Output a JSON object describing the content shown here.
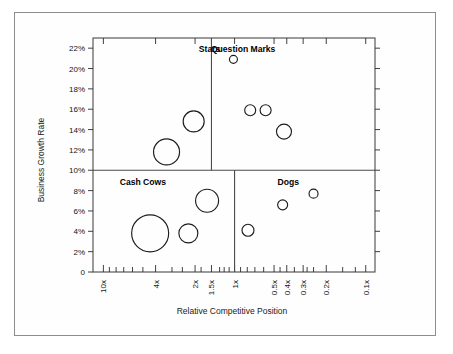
{
  "chart_data": {
    "type": "scatter",
    "title": "",
    "xlabel": "Relative Competitive Position",
    "ylabel": "Business Growth Rate",
    "grid": false,
    "legend": "none",
    "x_scale": "log-reversed",
    "x_tick_labels": [
      "10x",
      "4x",
      "2x",
      "1.5x",
      "1x",
      "0.5x",
      "0.4x",
      "0.3x",
      "0.2x",
      "0.1x"
    ],
    "x_tick_values": [
      10,
      4,
      2,
      1.5,
      1,
      0.5,
      0.4,
      0.3,
      0.2,
      0.1
    ],
    "y_tick_labels": [
      "0",
      "2%",
      "4%",
      "6%",
      "8%",
      "10%",
      "12%",
      "14%",
      "16%",
      "18%",
      "20%",
      "22%"
    ],
    "y_tick_values": [
      0,
      2,
      4,
      6,
      8,
      10,
      12,
      14,
      16,
      18,
      20,
      22
    ],
    "ylim": [
      0,
      23
    ],
    "quadrant_divider_growth": 10,
    "quadrant_divider_position_upper": 1.5,
    "quadrant_divider_position_lower": 1.0,
    "quadrants": [
      {
        "name": "stars",
        "label": "Stars",
        "x_label_pos": 1.55,
        "y_label_pos": 21.6
      },
      {
        "name": "question-marks",
        "label": "Question Marks",
        "x_label_pos": 0.86,
        "y_label_pos": 21.6
      },
      {
        "name": "cash-cows",
        "label": "Cash Cows",
        "x_label_pos": 5.0,
        "y_label_pos": 8.6
      },
      {
        "name": "dogs",
        "label": "Dogs",
        "x_label_pos": 0.39,
        "y_label_pos": 8.6
      }
    ],
    "series": [
      {
        "name": "Business Units",
        "points": [
          {
            "quadrant": "stars",
            "x": 2.05,
            "y": 14.8,
            "r": 10.5
          },
          {
            "quadrant": "stars",
            "x": 3.3,
            "y": 11.8,
            "r": 13.0
          },
          {
            "quadrant": "question-marks",
            "x": 1.02,
            "y": 20.9,
            "r": 4.0
          },
          {
            "quadrant": "question-marks",
            "x": 0.76,
            "y": 15.9,
            "r": 5.5
          },
          {
            "quadrant": "question-marks",
            "x": 0.58,
            "y": 15.9,
            "r": 5.5
          },
          {
            "quadrant": "question-marks",
            "x": 0.42,
            "y": 13.8,
            "r": 7.5
          },
          {
            "quadrant": "cash-cows",
            "x": 1.62,
            "y": 7.0,
            "r": 11.5
          },
          {
            "quadrant": "cash-cows",
            "x": 4.4,
            "y": 3.8,
            "r": 18.5
          },
          {
            "quadrant": "cash-cows",
            "x": 2.25,
            "y": 3.8,
            "r": 9.5
          },
          {
            "quadrant": "dogs",
            "x": 0.79,
            "y": 4.1,
            "r": 6.0
          },
          {
            "quadrant": "dogs",
            "x": 0.43,
            "y": 6.6,
            "r": 5.0
          },
          {
            "quadrant": "dogs",
            "x": 0.25,
            "y": 7.7,
            "r": 4.5
          }
        ]
      }
    ]
  }
}
